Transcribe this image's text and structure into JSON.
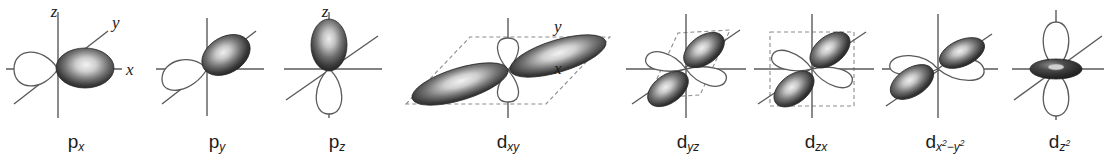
{
  "figure": {
    "background_color": "#ffffff",
    "line_color": "#5a5a5a",
    "lobe_dark_color": "#2b2b2b",
    "lobe_highlight_color": "#e8e8e8",
    "lobe_light_fill": "#ffffff",
    "dashed_plane_color": "#8c8c8c",
    "text_color": "#1b1b1b"
  },
  "orbitals": [
    {
      "id": "p-x",
      "symbol": "p",
      "subscript": "x",
      "superscript": "",
      "label_plain": "px",
      "type": "p",
      "axis_labels": [
        "z",
        "y",
        "x"
      ],
      "has_dashed_plane": false,
      "has_dashed_box": false,
      "lobe_count": 2,
      "shaded_lobes": 1
    },
    {
      "id": "p-y",
      "symbol": "p",
      "subscript": "y",
      "superscript": "",
      "label_plain": "py",
      "type": "p",
      "axis_labels": [],
      "has_dashed_plane": false,
      "has_dashed_box": false,
      "lobe_count": 2,
      "shaded_lobes": 1
    },
    {
      "id": "p-z",
      "symbol": "p",
      "subscript": "z",
      "superscript": "",
      "label_plain": "pz",
      "type": "p",
      "axis_labels": [
        "z"
      ],
      "has_dashed_plane": false,
      "has_dashed_box": false,
      "lobe_count": 2,
      "shaded_lobes": 1
    },
    {
      "id": "d-xy",
      "symbol": "d",
      "subscript": "xy",
      "superscript": "",
      "label_plain": "dxy",
      "type": "d",
      "axis_labels": [
        "y",
        "x"
      ],
      "has_dashed_plane": true,
      "has_dashed_box": false,
      "lobe_count": 4,
      "shaded_lobes": 2
    },
    {
      "id": "d-yz",
      "symbol": "d",
      "subscript": "yz",
      "superscript": "",
      "label_plain": "dyz",
      "type": "d",
      "axis_labels": [],
      "has_dashed_plane": false,
      "has_dashed_box": true,
      "lobe_count": 4,
      "shaded_lobes": 2
    },
    {
      "id": "d-zx",
      "symbol": "d",
      "subscript": "zx",
      "superscript": "",
      "label_plain": "dzx",
      "type": "d",
      "axis_labels": [],
      "has_dashed_plane": false,
      "has_dashed_box": true,
      "lobe_count": 4,
      "shaded_lobes": 2
    },
    {
      "id": "d-x2-y2",
      "symbol": "d",
      "subscript": "x",
      "superscript": "2",
      "subscript_tail": "−y",
      "superscript_tail": "2",
      "label_plain": "dx2−y2",
      "type": "d",
      "axis_labels": [],
      "has_dashed_plane": false,
      "has_dashed_box": false,
      "lobe_count": 4,
      "shaded_lobes": 2
    },
    {
      "id": "d-z2",
      "symbol": "d",
      "subscript": "z",
      "superscript": "2",
      "label_plain": "dz2",
      "type": "d",
      "axis_labels": [],
      "has_dashed_plane": false,
      "has_dashed_box": false,
      "lobe_count": 2,
      "shaded_lobes": 0,
      "has_torus": true
    }
  ]
}
